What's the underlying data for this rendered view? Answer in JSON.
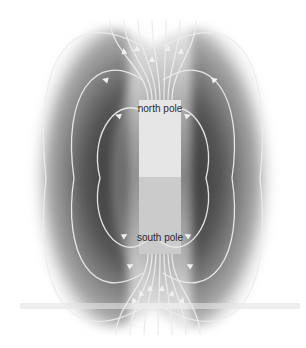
{
  "diagram": {
    "labels": {
      "north": "north pole",
      "south": "south pole"
    },
    "colors": {
      "background": "#ffffff",
      "field_shadow": "#3a3a3a",
      "field_line": "#e8e8e8",
      "magnet_north": "#e6e6e6",
      "magnet_south": "#c8c8c8",
      "label_text": "#2a2a2a"
    },
    "field_loops_per_side": 3,
    "field_direction": "north-to-south (arrows leave north pole upward, return to south pole from below)"
  }
}
